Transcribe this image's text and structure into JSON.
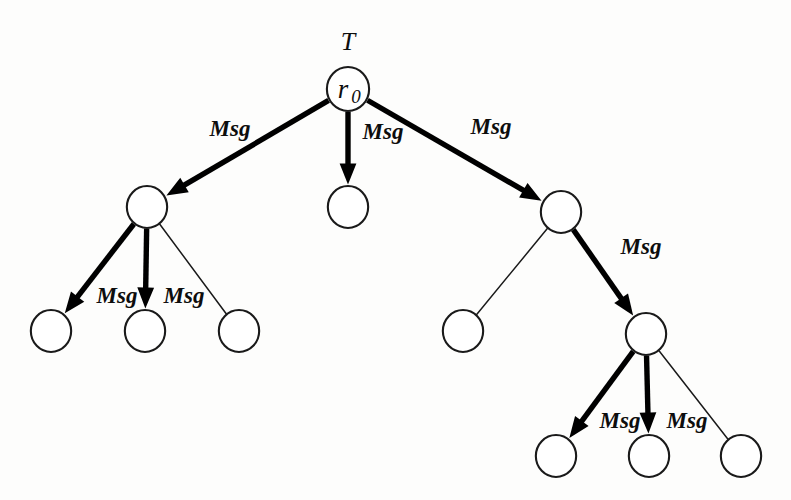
{
  "figure": {
    "type": "tree-diagram",
    "title_label": "T",
    "root_label": "r",
    "root_subscript": "0",
    "message_label": "Msg",
    "background_color": "#fdfdfc",
    "ink_color": "#1a1a1a"
  },
  "nodes": [
    {
      "id": "r0",
      "name": "root-node",
      "label": "r",
      "sub": "0",
      "cx": 348,
      "cy": 89,
      "r": 22
    },
    {
      "id": "n1",
      "name": "left-branch-node",
      "label": "",
      "sub": "",
      "cx": 147,
      "cy": 207,
      "r": 21
    },
    {
      "id": "n2",
      "name": "middle-branch-node",
      "label": "",
      "sub": "",
      "cx": 348,
      "cy": 207,
      "r": 21
    },
    {
      "id": "n3",
      "name": "right-branch-node",
      "label": "",
      "sub": "",
      "cx": 561,
      "cy": 212,
      "r": 21
    },
    {
      "id": "n4",
      "name": "left-leaf-one",
      "label": "",
      "sub": "",
      "cx": 51,
      "cy": 331,
      "r": 21
    },
    {
      "id": "n5",
      "name": "left-leaf-two",
      "label": "",
      "sub": "",
      "cx": 145,
      "cy": 331,
      "r": 21
    },
    {
      "id": "n6",
      "name": "left-leaf-three",
      "label": "",
      "sub": "",
      "cx": 239,
      "cy": 331,
      "r": 21
    },
    {
      "id": "n7",
      "name": "right-leaf-idle",
      "label": "",
      "sub": "",
      "cx": 463,
      "cy": 331,
      "r": 21
    },
    {
      "id": "n8",
      "name": "right-subtree-node",
      "label": "",
      "sub": "",
      "cx": 646,
      "cy": 334,
      "r": 21
    },
    {
      "id": "n9",
      "name": "bottom-leaf-one",
      "label": "",
      "sub": "",
      "cx": 556,
      "cy": 456,
      "r": 21
    },
    {
      "id": "n10",
      "name": "bottom-leaf-two",
      "label": "",
      "sub": "",
      "cx": 649,
      "cy": 456,
      "r": 21
    },
    {
      "id": "n11",
      "name": "bottom-leaf-three",
      "label": "",
      "sub": "",
      "cx": 741,
      "cy": 456,
      "r": 21
    }
  ],
  "edges": [
    {
      "name": "edge-root-to-left",
      "from": "r0",
      "to": "n1",
      "kind": "message",
      "label": "Msg",
      "lx": 230,
      "ly": 136
    },
    {
      "name": "edge-root-to-middle",
      "from": "r0",
      "to": "n2",
      "kind": "message",
      "label": "Msg",
      "lx": 383,
      "ly": 139
    },
    {
      "name": "edge-root-to-right",
      "from": "r0",
      "to": "n3",
      "kind": "message",
      "label": "Msg",
      "lx": 491,
      "ly": 134
    },
    {
      "name": "edge-left-to-leaf-one",
      "from": "n1",
      "to": "n4",
      "kind": "message",
      "label": "Msg",
      "lx": 117,
      "ly": 303
    },
    {
      "name": "edge-left-to-leaf-two",
      "from": "n1",
      "to": "n5",
      "kind": "message",
      "label": "Msg",
      "lx": 184,
      "ly": 303
    },
    {
      "name": "edge-left-to-leaf-three",
      "from": "n1",
      "to": "n6",
      "kind": "plain",
      "label": "",
      "lx": 0,
      "ly": 0
    },
    {
      "name": "edge-right-to-idle-leaf",
      "from": "n3",
      "to": "n7",
      "kind": "plain",
      "label": "",
      "lx": 0,
      "ly": 0
    },
    {
      "name": "edge-right-to-subtree",
      "from": "n3",
      "to": "n8",
      "kind": "message",
      "label": "Msg",
      "lx": 641,
      "ly": 254
    },
    {
      "name": "edge-subtree-to-leaf-one",
      "from": "n8",
      "to": "n9",
      "kind": "message",
      "label": "Msg",
      "lx": 620,
      "ly": 428
    },
    {
      "name": "edge-subtree-to-leaf-two",
      "from": "n8",
      "to": "n10",
      "kind": "message",
      "label": "Msg",
      "lx": 687,
      "ly": 428
    },
    {
      "name": "edge-subtree-to-leaf-three",
      "from": "n8",
      "to": "n11",
      "kind": "plain",
      "label": "",
      "lx": 0,
      "ly": 0
    }
  ],
  "tree_label": {
    "text": "T",
    "x": 348,
    "y": 50
  }
}
